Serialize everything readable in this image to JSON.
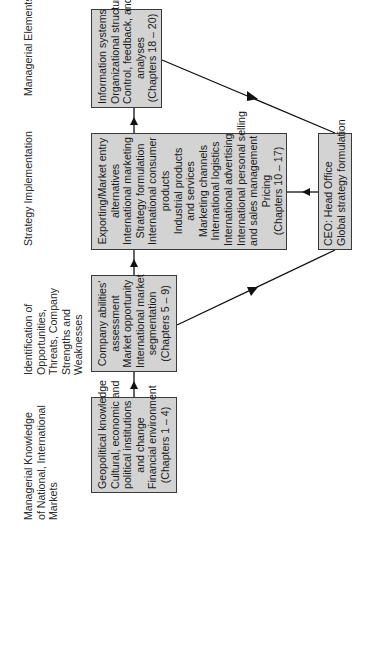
{
  "diagram": {
    "columns": [
      {
        "header": [
          "Managerial Knowledge",
          "of National, International",
          "Markets"
        ]
      },
      {
        "header": [
          "Identification of",
          "Opportunities,",
          "Threats, Company",
          "Strengths and",
          "Weaknesses"
        ]
      },
      {
        "header": [
          "Strategy Implementation"
        ]
      },
      {
        "header": [
          "Managerial Elements"
        ]
      }
    ],
    "boxes": {
      "knowledge": {
        "lines": [
          "Geopolitical knowledge",
          "Cultural, economic and",
          "political institutions",
          "and change",
          "Financial environment",
          "(Chapters 1 – 4)"
        ]
      },
      "identification": {
        "lines": [
          "Company abilities'",
          "assessment",
          "Market opportunity",
          "International market",
          "segmentation",
          "(Chapters 5 – 9)"
        ]
      },
      "implementation": {
        "lines": [
          "Exporting/Market entry",
          "alternatives",
          "International marketing",
          "Strategy formulation",
          "International consumer",
          "products",
          "Industrial products",
          "and services",
          "Marketing channels",
          "International logistics",
          "International advertising",
          "International personal selling",
          "and sales management",
          "Pricing",
          "(Chapters 10 – 17)"
        ]
      },
      "elements": {
        "lines": [
          "Information systems",
          "Organizational structure",
          "Control, feedback, and",
          "analyses",
          "(Chapters 18 – 20)"
        ]
      },
      "ceo": {
        "lines": [
          "CEO:  Head Office",
          "Global strategy formulation"
        ]
      }
    },
    "colors": {
      "box_fill": "#d3d3d3",
      "stroke": "#1a1a1a"
    }
  }
}
